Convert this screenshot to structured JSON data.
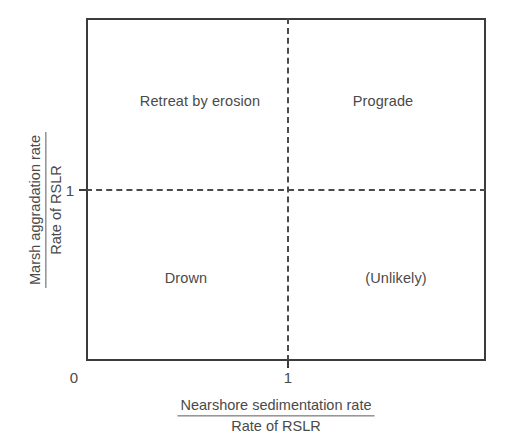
{
  "chart_data": {
    "type": "scatter",
    "title": "",
    "subtitle": "",
    "xlabel_numerator": "Nearshore sedimentation rate",
    "xlabel_denominator": "Rate of RSLR",
    "ylabel_numerator": "Marsh aggradation rate",
    "ylabel_denominator": "Rate of RSLR",
    "xlim": [
      0,
      1.98
    ],
    "ylim": [
      0,
      1.7
    ],
    "x_ticks": [
      "0",
      "1"
    ],
    "x_tick_values": [
      0,
      1
    ],
    "y_ticks": [
      "1"
    ],
    "y_tick_values": [
      1
    ],
    "grid": false,
    "legend": "none",
    "threshold_x": 1,
    "threshold_y": 1,
    "threshold_style": "dashed",
    "quadrants": [
      {
        "id": "top-left",
        "label": "Retreat by erosion",
        "x_range": "< 1",
        "y_range": "> 1"
      },
      {
        "id": "top-right",
        "label": "Prograde",
        "x_range": "> 1",
        "y_range": "> 1"
      },
      {
        "id": "bottom-left",
        "label": "Drown",
        "x_range": "< 1",
        "y_range": "< 1"
      },
      {
        "id": "bottom-right",
        "label": "(Unlikely)",
        "x_range": "> 1",
        "y_range": "< 1"
      }
    ],
    "annotations": [],
    "series": [],
    "colors": {
      "frame": "#3b3b3b",
      "divider": "#4a4a4a",
      "text": "#4a4a4a",
      "background": "#ffffff"
    }
  },
  "axes": {
    "x": {
      "numerator": "Nearshore sedimentation rate",
      "denominator": "Rate of RSLR",
      "ticks": [
        {
          "label": "0"
        },
        {
          "label": "1"
        }
      ]
    },
    "y": {
      "numerator": "Marsh aggradation rate",
      "denominator": "Rate of RSLR",
      "ticks": [
        {
          "label": "1"
        }
      ]
    }
  },
  "quadrant_labels": {
    "top_left": "Retreat by erosion",
    "top_right": "Prograde",
    "bottom_left": "Drown",
    "bottom_right": "(Unlikely)"
  }
}
